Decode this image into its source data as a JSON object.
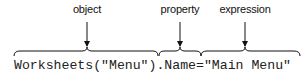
{
  "labels": {
    "object": "object",
    "property": "property",
    "expression": "expression"
  },
  "code": "Worksheets(\"Menu\").Name=\"Main Menu\"",
  "colors": {
    "text": "#222222",
    "lines": "#111111"
  }
}
